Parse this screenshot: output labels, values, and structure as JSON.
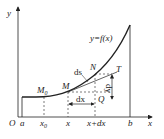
{
  "diagram": {
    "curve_label": "y=f(x)",
    "axes": {
      "x_label": "x",
      "y_label": "y",
      "origin_label": "O"
    },
    "x_ticks": [
      {
        "label": "a",
        "x": 22
      },
      {
        "label": "x0",
        "x": 44
      },
      {
        "label": "x",
        "x": 68
      },
      {
        "label": "x+dx",
        "x": 95
      },
      {
        "label": "b",
        "x": 130
      }
    ],
    "points": {
      "M0": "M0",
      "M": "M",
      "N": "N",
      "T": "T",
      "Q": "Q"
    },
    "annotations": {
      "ds": "ds",
      "dx": "dx",
      "dy": "dy"
    },
    "colors": {
      "line": "#222222",
      "background": "#ffffff"
    }
  }
}
